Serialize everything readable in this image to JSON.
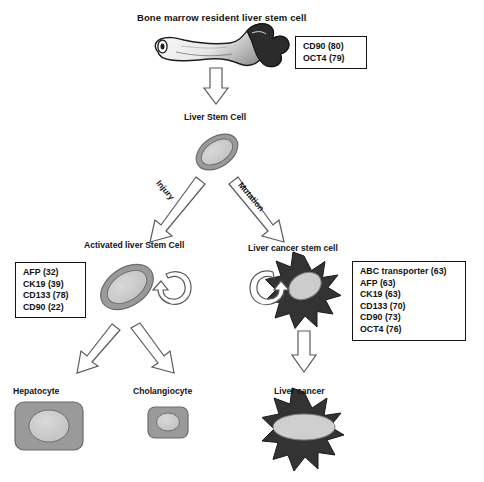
{
  "figure": {
    "title": "Bone marrow resident liver stem cell",
    "caption": ""
  },
  "nodes": {
    "bone_marrow": {
      "label": "Bone marrow resident liver stem cell",
      "icon": "long-bone-icon"
    },
    "liver_stem_cell": {
      "label": "Liver Stem Cell",
      "icon": "oval-cell-icon"
    },
    "activated_liver_stem_cell": {
      "label": "Activated liver Stem Cell",
      "icon": "oval-cell-icon"
    },
    "liver_cancer_stem_cell": {
      "label": "Liver cancer stem cell",
      "icon": "star-cell-icon"
    },
    "hepatocyte": {
      "label": "Hepatocyte",
      "icon": "rounded-cell-icon"
    },
    "cholangiocyte": {
      "label": "Cholangiocyte",
      "icon": "rounded-cell-icon"
    },
    "liver_cancer": {
      "label": "Liver cancer",
      "icon": "star-cell-icon"
    }
  },
  "edges": {
    "injury": "Injury",
    "mutation": "Mutation"
  },
  "marker_boxes": {
    "bone_marrow_markers": {
      "items": [
        "CD90 (80)",
        "OCT4 (79)"
      ]
    },
    "activated_markers": {
      "items": [
        "AFP (32)",
        "CK19 (39)",
        "CD133 (78)",
        "CD90 (22)"
      ]
    },
    "cancer_stem_markers": {
      "items": [
        "ABC transporter (63)",
        "AFP (63)",
        "CK19 (63)",
        "CD133 (70)",
        "CD90 (73)",
        "OCT4 (76)"
      ]
    }
  },
  "colors": {
    "cell_membrane_gray": "#9a9a9a",
    "cell_nucleus_gray": "#c9c9c9",
    "tumor_dark": "#333333",
    "outline": "#111111",
    "arrow_outline": "#555555",
    "arrow_fill": "#ffffff"
  }
}
